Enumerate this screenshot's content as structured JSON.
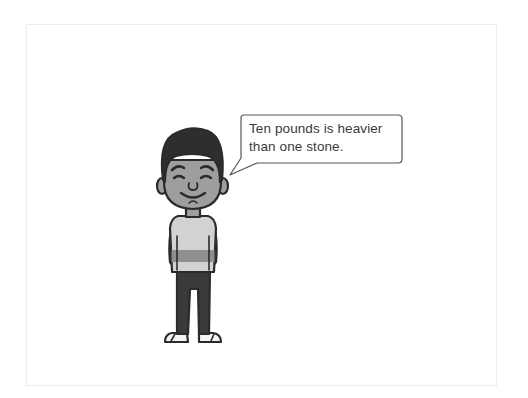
{
  "scene": {
    "description": "Cartoon boy standing with speech bubble",
    "speech_bubble": {
      "line1": "Ten pounds is heavier",
      "line2": "than one stone."
    },
    "colors": {
      "outline": "#2b2b2b",
      "skin": "#9e9e9e",
      "hair": "#2e2e2e",
      "shirt": "#d2d2d2",
      "shirt_stripe": "#8e8e8e",
      "pants": "#3a3a3a",
      "sandal": "#f4f4f4",
      "bubble_border": "#555555",
      "frame_border": "#ececec"
    }
  }
}
